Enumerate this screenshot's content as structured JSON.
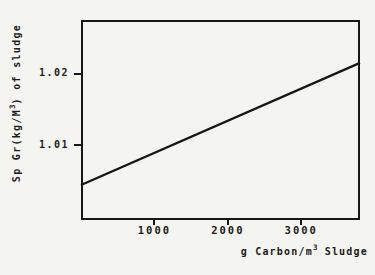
{
  "chart_data": {
    "type": "line",
    "title": "",
    "xlabel": {
      "prefix": "g Carbon/m",
      "sup": "3",
      "suffix": " Sludge"
    },
    "ylabel": {
      "prefix": "Sp Gr(kg/M",
      "sup": "3",
      "suffix": ") of sludge"
    },
    "xlim": [
      0,
      3800
    ],
    "ylim": [
      0.9995,
      1.0275
    ],
    "grid": false,
    "legend": null,
    "x_ticks": [
      {
        "value": 1000,
        "label": "1000"
      },
      {
        "value": 2000,
        "label": "2000"
      },
      {
        "value": 3000,
        "label": "3000"
      }
    ],
    "y_ticks": [
      {
        "value": 1.01,
        "label": "1.01"
      },
      {
        "value": 1.02,
        "label": "1.02"
      }
    ],
    "series": [
      {
        "name": "sludge-specific-gravity",
        "points": [
          [
            0,
            1.0044
          ],
          [
            3800,
            1.0215
          ]
        ]
      }
    ],
    "colors": {
      "line": "#161616",
      "frame": "#161616",
      "background": "#f4f4f0",
      "text": "#1c1c1c"
    }
  }
}
